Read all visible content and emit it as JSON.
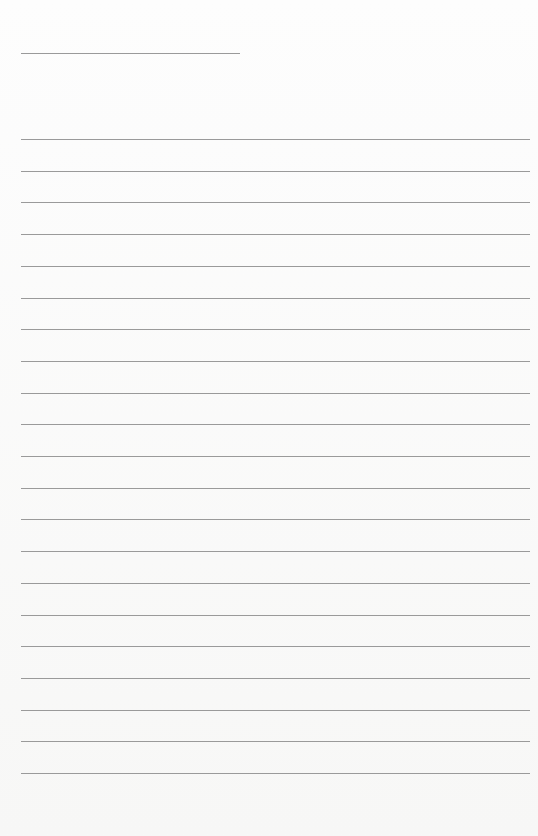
{
  "page": {
    "type": "blank lined writing paper",
    "header_line": {
      "x": 21,
      "y": 53,
      "width": 219
    },
    "ruled_lines": {
      "count": 21,
      "first_y": 139,
      "last_y": 773,
      "left_x": 21,
      "right_x": 530,
      "color": "#9a9a9a"
    },
    "background_color": "#f9f9f8"
  }
}
